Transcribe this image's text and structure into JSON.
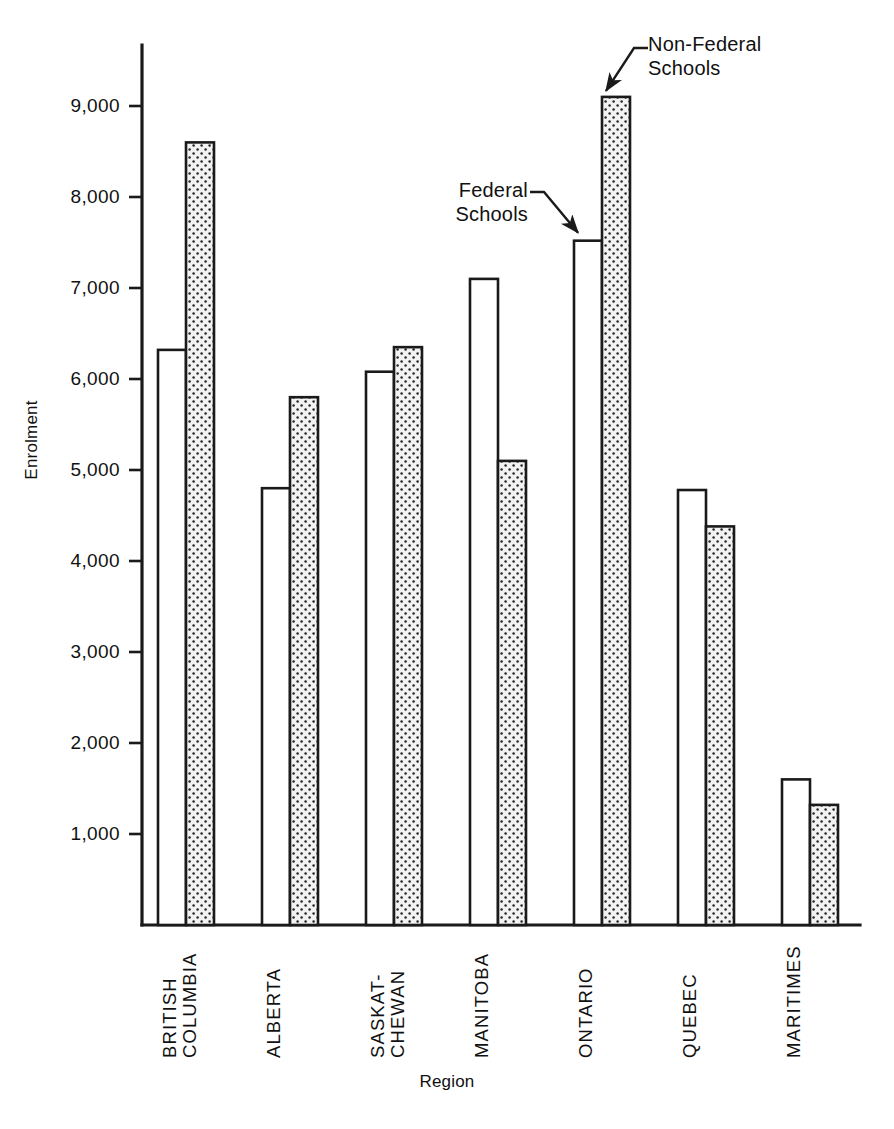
{
  "chart_data": {
    "type": "bar",
    "title": "",
    "xlabel": "Region",
    "ylabel": "Enrolment",
    "categories": [
      "BRITISH COLUMBIA",
      "ALBERTA",
      "SASKAT- CHEWAN",
      "MANITOBA",
      "ONTARIO",
      "QUEBEC",
      "MARITIMES"
    ],
    "category_lines": [
      [
        "BRITISH",
        "COLUMBIA"
      ],
      [
        "ALBERTA",
        ""
      ],
      [
        "SASKAT-",
        "CHEWAN"
      ],
      [
        "MANITOBA",
        ""
      ],
      [
        "ONTARIO",
        ""
      ],
      [
        "QUEBEC",
        ""
      ],
      [
        "MARITIMES",
        ""
      ]
    ],
    "series": [
      {
        "name": "Federal Schools",
        "style": "white",
        "values": [
          6320,
          4800,
          6080,
          7100,
          7520,
          4780,
          1600
        ]
      },
      {
        "name": "Non-Federal Schools",
        "style": "stippled",
        "values": [
          8600,
          5800,
          6350,
          5100,
          9100,
          4380,
          1320
        ]
      }
    ],
    "ylim": [
      0,
      9600
    ],
    "yticks": [
      1000,
      2000,
      3000,
      4000,
      5000,
      6000,
      7000,
      8000,
      9000
    ],
    "ytick_labels": [
      "1,000",
      "2,000",
      "3,000",
      "4,000",
      "5,000",
      "6,000",
      "7,000",
      "8,000",
      "9,000"
    ],
    "grid": false,
    "legend": "annotations"
  },
  "annotations": [
    {
      "name": "non-federal-schools",
      "lines": [
        "Non-Federal",
        "Schools"
      ]
    },
    {
      "name": "federal-schools",
      "lines": [
        "Federal",
        "Schools"
      ]
    }
  ],
  "colors": {
    "axis": "#1a1a1a",
    "bar_outline": "#1a1a1a",
    "bar_federal_fill": "#ffffff",
    "bar_nonfederal_fill": "#efefef",
    "bar_nonfederal_dot": "#2b2b2b",
    "text": "#111111"
  }
}
